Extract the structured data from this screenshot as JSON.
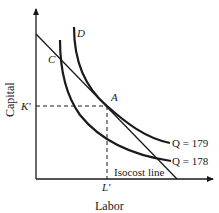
{
  "diagram": {
    "type": "isoquant-isocost",
    "axes": {
      "x_label": "Labor",
      "y_label": "Capital"
    },
    "points": {
      "A": "A",
      "C": "C",
      "D": "D"
    },
    "ticks": {
      "k_prime": "K'",
      "l_prime": "L'"
    },
    "curves": {
      "q179_label": "Q = 179",
      "q178_label": "Q = 178",
      "isocost_label": "Isocost line"
    },
    "colors": {
      "line": "#1a1a1a",
      "background": "#ffffff"
    }
  }
}
